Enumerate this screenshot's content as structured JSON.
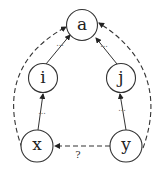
{
  "diagram": {
    "nodes": [
      {
        "id": "a",
        "label": "a"
      },
      {
        "id": "i",
        "label": "i"
      },
      {
        "id": "j",
        "label": "j"
      },
      {
        "id": "x",
        "label": "x"
      },
      {
        "id": "y",
        "label": "y"
      }
    ],
    "edges": [
      {
        "from": "i",
        "to": "a",
        "style": "solid",
        "label": "..."
      },
      {
        "from": "j",
        "to": "a",
        "style": "solid",
        "label": "..."
      },
      {
        "from": "x",
        "to": "i",
        "style": "solid",
        "label": "..."
      },
      {
        "from": "y",
        "to": "j",
        "style": "solid",
        "label": "..."
      },
      {
        "from": "x",
        "to": "a",
        "style": "dashed",
        "label": ""
      },
      {
        "from": "y",
        "to": "a",
        "style": "dashed",
        "label": ""
      },
      {
        "from": "y",
        "to": "x",
        "style": "dashed",
        "label": "?"
      }
    ],
    "edge_labels": {
      "ellipsis": "...",
      "question": "?"
    }
  }
}
